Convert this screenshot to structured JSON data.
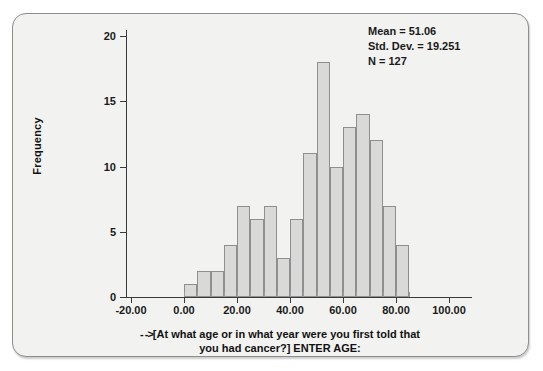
{
  "chart_data": {
    "type": "bar",
    "title": "",
    "subtitle": "",
    "xlabel_arrow": "- ->",
    "xlabel": "[At what age or in what year were you first told that you had cancer?] ENTER AGE:",
    "xlabel_line1": "[At what age or in what year were you first told that",
    "xlabel_line2": "you had cancer?] ENTER AGE:",
    "ylabel": "Frequency",
    "xlim": [
      -25,
      105
    ],
    "ylim": [
      0,
      21
    ],
    "grid": false,
    "legend": false,
    "bin_width": 5,
    "categories": [
      "0-5",
      "5-10",
      "10-15",
      "15-20",
      "20-25",
      "25-30",
      "30-35",
      "35-40",
      "40-45",
      "45-50",
      "50-55",
      "55-60",
      "60-65",
      "65-70",
      "70-75",
      "75-80",
      "80-85"
    ],
    "bin_starts": [
      0,
      5,
      10,
      15,
      20,
      25,
      30,
      35,
      40,
      45,
      50,
      55,
      60,
      65,
      70,
      75,
      80
    ],
    "values": [
      1,
      2,
      2,
      4,
      7,
      6,
      7,
      3,
      6,
      11,
      18,
      10,
      13,
      14,
      12,
      7,
      4
    ],
    "x_ticks": [
      -20,
      0,
      20,
      40,
      60,
      80,
      100
    ],
    "x_tick_labels": [
      "-20.00",
      "0.00",
      "20.00",
      "40.00",
      "60.00",
      "80.00",
      "100.00"
    ],
    "y_ticks": [
      0,
      5,
      10,
      15,
      20
    ],
    "y_tick_labels": [
      "0",
      "5",
      "10",
      "15",
      "20"
    ],
    "annotations": {
      "mean_label": "Mean = 51.06",
      "std_dev_label": "Std. Dev. = 19.251",
      "n_label": "N = 127"
    },
    "colors": {
      "bar_fill": "#d9d9d7",
      "bar_border": "#8f8f8f",
      "panel_background": "#f2f2f0",
      "panel_border": "#8d8d8d",
      "axis": "#3a3a3a",
      "text": "#111111"
    }
  }
}
